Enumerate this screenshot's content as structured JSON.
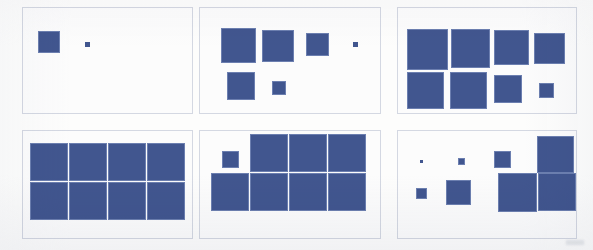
{
  "figure": {
    "width": 593,
    "height": 250,
    "background_color": "#fdfdfc",
    "panel_border_color": "#d4d8e2",
    "square_fill_color": "#41568f",
    "square_border_color": "#6c7fb0",
    "panel_count": 6,
    "grid_rows": 2,
    "grid_cols": 3
  },
  "panels": [
    {
      "id": "panel-1",
      "name": "panel-top-left",
      "row": 1,
      "col": 1,
      "x": 22,
      "y": 7,
      "w": 171,
      "h": 107,
      "square_count": 2,
      "squares": [
        {
          "x": 15,
          "y": 23,
          "size": 22
        },
        {
          "x": 62,
          "y": 34,
          "size": 5
        }
      ]
    },
    {
      "id": "panel-2",
      "name": "panel-top-center",
      "row": 1,
      "col": 2,
      "x": 199,
      "y": 7,
      "w": 182,
      "h": 107,
      "square_count": 6,
      "squares": [
        {
          "x": 21,
          "y": 20,
          "size": 35
        },
        {
          "x": 62,
          "y": 22,
          "size": 32
        },
        {
          "x": 106,
          "y": 25,
          "size": 23
        },
        {
          "x": 153,
          "y": 34,
          "size": 5
        },
        {
          "x": 27,
          "y": 64,
          "size": 28
        },
        {
          "x": 72,
          "y": 73,
          "size": 14
        }
      ]
    },
    {
      "id": "panel-3",
      "name": "panel-top-right",
      "row": 1,
      "col": 3,
      "x": 397,
      "y": 7,
      "w": 180,
      "h": 107,
      "square_count": 8,
      "squares": [
        {
          "x": 9,
          "y": 21,
          "size": 41
        },
        {
          "x": 53,
          "y": 21,
          "size": 39
        },
        {
          "x": 96,
          "y": 22,
          "size": 35
        },
        {
          "x": 136,
          "y": 25,
          "size": 31
        },
        {
          "x": 9,
          "y": 64,
          "size": 37
        },
        {
          "x": 52,
          "y": 64,
          "size": 37
        },
        {
          "x": 96,
          "y": 67,
          "size": 28
        },
        {
          "x": 141,
          "y": 75,
          "size": 15
        }
      ]
    },
    {
      "id": "panel-4",
      "name": "panel-bottom-left",
      "row": 2,
      "col": 1,
      "x": 22,
      "y": 130,
      "w": 171,
      "h": 109,
      "square_count": 8,
      "squares": [
        {
          "x": 7,
          "y": 12,
          "size": 38
        },
        {
          "x": 46,
          "y": 12,
          "size": 38
        },
        {
          "x": 85,
          "y": 12,
          "size": 38
        },
        {
          "x": 124,
          "y": 12,
          "size": 38
        },
        {
          "x": 7,
          "y": 51,
          "size": 38
        },
        {
          "x": 46,
          "y": 51,
          "size": 38
        },
        {
          "x": 85,
          "y": 51,
          "size": 38
        },
        {
          "x": 124,
          "y": 51,
          "size": 38
        }
      ]
    },
    {
      "id": "panel-5",
      "name": "panel-bottom-center",
      "row": 2,
      "col": 2,
      "x": 199,
      "y": 130,
      "w": 182,
      "h": 109,
      "square_count": 8,
      "squares": [
        {
          "x": 22,
          "y": 20,
          "size": 17
        },
        {
          "x": 50,
          "y": 3,
          "size": 38
        },
        {
          "x": 89,
          "y": 3,
          "size": 38
        },
        {
          "x": 128,
          "y": 3,
          "size": 38
        },
        {
          "x": 11,
          "y": 42,
          "size": 38
        },
        {
          "x": 50,
          "y": 42,
          "size": 38
        },
        {
          "x": 89,
          "y": 42,
          "size": 38
        },
        {
          "x": 128,
          "y": 42,
          "size": 38
        }
      ]
    },
    {
      "id": "panel-6",
      "name": "panel-bottom-right",
      "row": 2,
      "col": 3,
      "x": 397,
      "y": 130,
      "w": 180,
      "h": 109,
      "square_count": 8,
      "squares": [
        {
          "x": 22,
          "y": 29,
          "size": 3
        },
        {
          "x": 60,
          "y": 27,
          "size": 7
        },
        {
          "x": 96,
          "y": 20,
          "size": 17
        },
        {
          "x": 139,
          "y": 5,
          "size": 37
        },
        {
          "x": 18,
          "y": 57,
          "size": 11
        },
        {
          "x": 48,
          "y": 49,
          "size": 25
        },
        {
          "x": 100,
          "y": 42,
          "size": 39
        },
        {
          "x": 140,
          "y": 42,
          "size": 38
        }
      ]
    }
  ]
}
